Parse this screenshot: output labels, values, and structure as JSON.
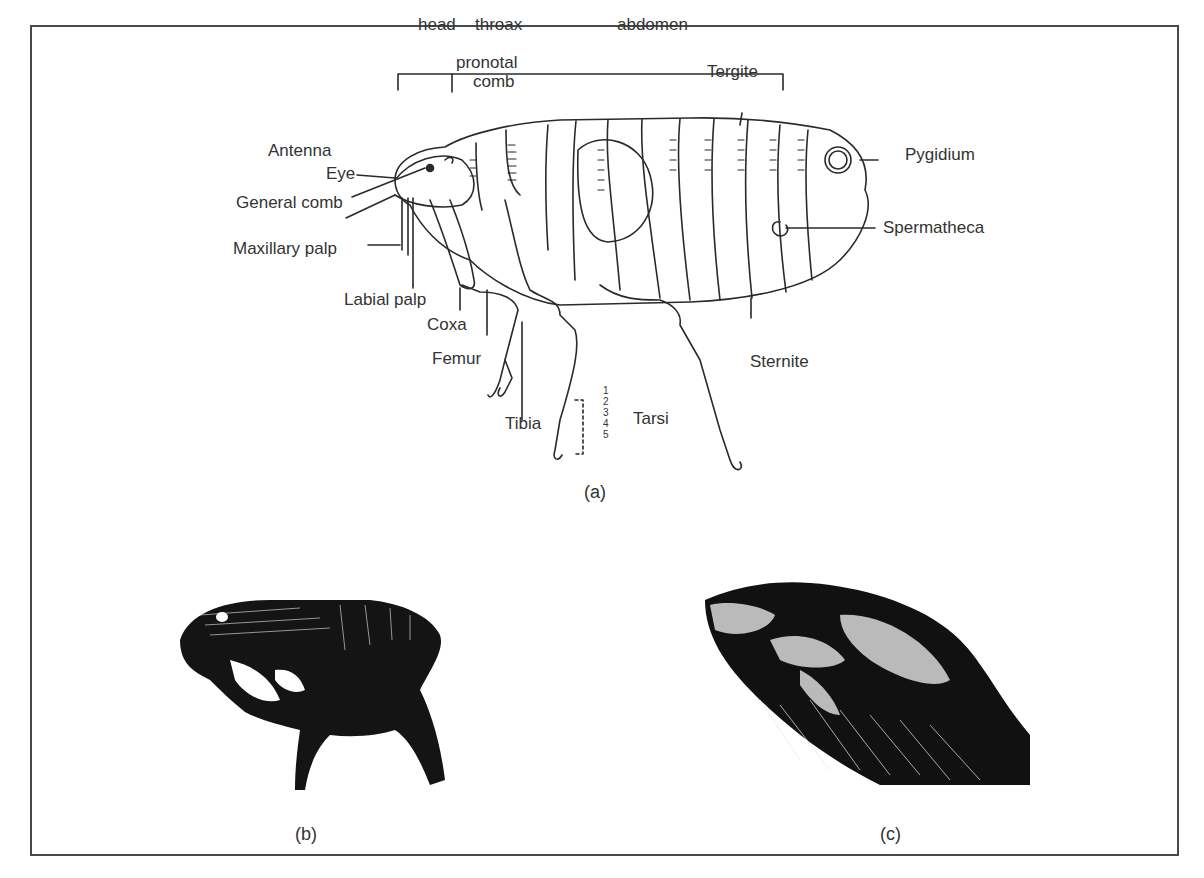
{
  "figure": {
    "panel_a": {
      "caption": "(a)",
      "regions": {
        "head": "head",
        "thorax": "throax",
        "abdomen": "abdomen"
      },
      "labels": {
        "pronotal_comb_1": "pronotal",
        "pronotal_comb_2": "comb",
        "tergite": "Tergite",
        "antenna": "Antenna",
        "eye": "Eye",
        "general_comb": "General comb",
        "maxillary_palp": "Maxillary palp",
        "labial_palp": "Labial palp",
        "coxa": "Coxa",
        "femur": "Femur",
        "tibia": "Tibia",
        "tarsi": "Tarsi",
        "tarsi_numbers": [
          "1",
          "2",
          "3",
          "4",
          "5"
        ],
        "sternite": "Sternite",
        "pygidium": "Pygidium",
        "spermatheca": "Spermatheca"
      }
    },
    "panel_b": {
      "caption": "(b)"
    },
    "panel_c": {
      "caption": "(c)"
    },
    "colors": {
      "ink": "#2a2a2a",
      "frame": "#4a4a4a",
      "background": "#ffffff"
    }
  }
}
